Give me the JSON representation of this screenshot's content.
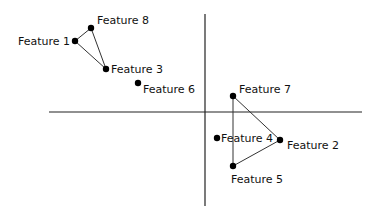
{
  "chart_data": {
    "type": "scatter",
    "title": "",
    "xlabel": "",
    "ylabel": "",
    "grid": false,
    "legend": null,
    "axes": {
      "horizontal": {
        "x1": 49,
        "x2": 362,
        "y": 112
      },
      "vertical": {
        "x": 205,
        "y1": 14,
        "y2": 206
      }
    },
    "points": [
      {
        "name": "Feature 1",
        "px": 75,
        "py": 41,
        "label_dx": -57,
        "label_dy": 4
      },
      {
        "name": "Feature 8",
        "px": 91,
        "py": 28,
        "label_dx": 6,
        "label_dy": -4
      },
      {
        "name": "Feature 3",
        "px": 106,
        "py": 69,
        "label_dx": 5,
        "label_dy": 4
      },
      {
        "name": "Feature 6",
        "px": 138,
        "py": 83,
        "label_dx": 5,
        "label_dy": 10
      },
      {
        "name": "Feature 7",
        "px": 233,
        "py": 96,
        "label_dx": 6,
        "label_dy": -3
      },
      {
        "name": "Feature 4",
        "px": 217,
        "py": 138,
        "label_dx": 4,
        "label_dy": 4
      },
      {
        "name": "Feature 2",
        "px": 280,
        "py": 140,
        "label_dx": 7,
        "label_dy": 9
      },
      {
        "name": "Feature 5",
        "px": 233,
        "py": 166,
        "label_dx": -2,
        "label_dy": 17
      }
    ],
    "edges": [
      [
        "Feature 1",
        "Feature 8"
      ],
      [
        "Feature 8",
        "Feature 3"
      ],
      [
        "Feature 3",
        "Feature 1"
      ],
      [
        "Feature 7",
        "Feature 2"
      ],
      [
        "Feature 2",
        "Feature 5"
      ],
      [
        "Feature 5",
        "Feature 7"
      ]
    ]
  }
}
